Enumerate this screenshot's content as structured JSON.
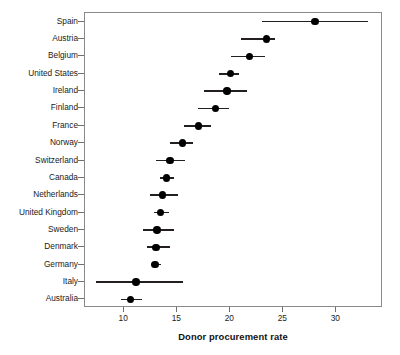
{
  "chart_data": {
    "type": "scatter",
    "title": "",
    "subtitle": "",
    "xlabel": "Donor procurement rate",
    "ylabel": "",
    "orientation": "horizontal",
    "grid": false,
    "legend": null,
    "xlim": [
      6.3,
      34.4
    ],
    "xticks": [
      10,
      15,
      20,
      25,
      30
    ],
    "xticklabels": [
      "10",
      "15",
      "20",
      "25",
      "30"
    ],
    "categories": [
      "Spain",
      "Austria",
      "Belgium",
      "United States",
      "Ireland",
      "Finland",
      "France",
      "Norway",
      "Switzerland",
      "Canada",
      "Netherlands",
      "United Kingdom",
      "Sweden",
      "Denmark",
      "Germany",
      "Italy",
      "Australia"
    ],
    "values": [
      28.0,
      23.4,
      21.8,
      20.0,
      19.7,
      18.6,
      17.0,
      15.5,
      14.3,
      14.0,
      13.6,
      13.4,
      13.1,
      13.0,
      12.9,
      11.1,
      10.6
    ],
    "ci_low": [
      23.0,
      21.0,
      20.1,
      18.9,
      17.5,
      17.0,
      15.6,
      14.3,
      13.0,
      13.4,
      12.4,
      12.8,
      11.8,
      12.1,
      12.5,
      7.3,
      9.7
    ],
    "ci_high": [
      33.0,
      24.2,
      23.3,
      20.8,
      21.6,
      19.9,
      18.2,
      16.5,
      15.7,
      14.7,
      15.1,
      14.2,
      14.7,
      14.3,
      13.5,
      15.5,
      11.7
    ],
    "marker": "filled-circle",
    "marker_color": "#000000",
    "line_color": "#231f20"
  }
}
